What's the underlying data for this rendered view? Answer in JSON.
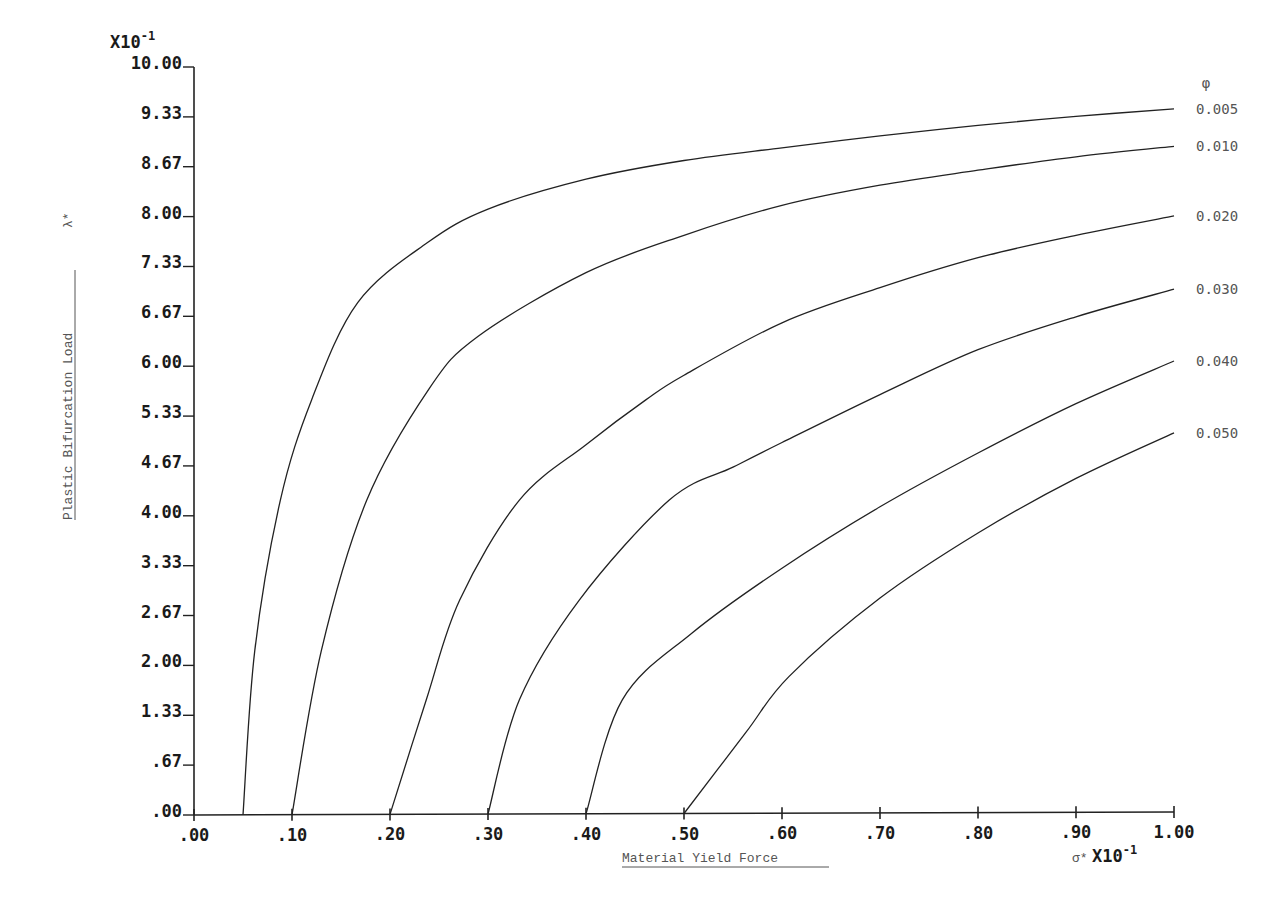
{
  "chart_data": {
    "type": "line",
    "title": "",
    "xlabel": "Material Yield Force",
    "xlabel_symbol": "σ*",
    "x_multiplier": "X10",
    "x_multiplier_exp": "-1",
    "ylabel": "Plastic Bifurcation Load",
    "ylabel_symbol": "λ*",
    "y_multiplier": "X10",
    "y_multiplier_exp": "-1",
    "xlim": [
      0,
      1
    ],
    "ylim": [
      0,
      10
    ],
    "grid": false,
    "legend_title": "φ",
    "legend_position": "right, at curve ends",
    "x_ticks": [
      {
        "value": 0.0,
        "label": ".00"
      },
      {
        "value": 0.1,
        "label": ".10"
      },
      {
        "value": 0.2,
        "label": ".20"
      },
      {
        "value": 0.3,
        "label": ".30"
      },
      {
        "value": 0.4,
        "label": ".40"
      },
      {
        "value": 0.5,
        "label": ".50"
      },
      {
        "value": 0.6,
        "label": ".60"
      },
      {
        "value": 0.7,
        "label": ".70"
      },
      {
        "value": 0.8,
        "label": ".80"
      },
      {
        "value": 0.9,
        "label": ".90"
      },
      {
        "value": 1.0,
        "label": "1.00"
      }
    ],
    "y_ticks": [
      {
        "value": 0.0,
        "label": ".00"
      },
      {
        "value": 0.667,
        "label": ".67"
      },
      {
        "value": 1.333,
        "label": "1.33"
      },
      {
        "value": 2.0,
        "label": "2.00"
      },
      {
        "value": 2.667,
        "label": "2.67"
      },
      {
        "value": 3.333,
        "label": "3.33"
      },
      {
        "value": 4.0,
        "label": "4.00"
      },
      {
        "value": 4.667,
        "label": "4.67"
      },
      {
        "value": 5.333,
        "label": "5.33"
      },
      {
        "value": 6.0,
        "label": "6.00"
      },
      {
        "value": 6.667,
        "label": "6.67"
      },
      {
        "value": 7.333,
        "label": "7.33"
      },
      {
        "value": 8.0,
        "label": "8.00"
      },
      {
        "value": 8.667,
        "label": "8.67"
      },
      {
        "value": 9.333,
        "label": "9.33"
      },
      {
        "value": 10.0,
        "label": "10.00"
      }
    ],
    "series": [
      {
        "name": "0.005",
        "points": [
          [
            0.05,
            0
          ],
          [
            0.062,
            2.2
          ],
          [
            0.088,
            4.2
          ],
          [
            0.12,
            5.55
          ],
          [
            0.167,
            6.85
          ],
          [
            0.238,
            7.65
          ],
          [
            0.3,
            8.1
          ],
          [
            0.4,
            8.5
          ],
          [
            0.5,
            8.75
          ],
          [
            0.6,
            8.92
          ],
          [
            0.7,
            9.08
          ],
          [
            0.8,
            9.22
          ],
          [
            0.9,
            9.34
          ],
          [
            1.0,
            9.44
          ]
        ]
      },
      {
        "name": "0.010",
        "points": [
          [
            0.1,
            0
          ],
          [
            0.13,
            2.2
          ],
          [
            0.176,
            4.2
          ],
          [
            0.24,
            5.7
          ],
          [
            0.29,
            6.4
          ],
          [
            0.4,
            7.25
          ],
          [
            0.5,
            7.75
          ],
          [
            0.6,
            8.15
          ],
          [
            0.7,
            8.42
          ],
          [
            0.8,
            8.62
          ],
          [
            0.9,
            8.8
          ],
          [
            1.0,
            8.94
          ]
        ]
      },
      {
        "name": "0.020",
        "points": [
          [
            0.2,
            0
          ],
          [
            0.237,
            1.54
          ],
          [
            0.271,
            2.87
          ],
          [
            0.332,
            4.21
          ],
          [
            0.4,
            4.95
          ],
          [
            0.461,
            5.55
          ],
          [
            0.5,
            5.88
          ],
          [
            0.6,
            6.58
          ],
          [
            0.7,
            7.05
          ],
          [
            0.8,
            7.45
          ],
          [
            0.9,
            7.75
          ],
          [
            1.0,
            8.01
          ]
        ]
      },
      {
        "name": "0.030",
        "points": [
          [
            0.3,
            0
          ],
          [
            0.332,
            1.54
          ],
          [
            0.393,
            2.87
          ],
          [
            0.485,
            4.21
          ],
          [
            0.55,
            4.65
          ],
          [
            0.6,
            4.98
          ],
          [
            0.7,
            5.62
          ],
          [
            0.8,
            6.22
          ],
          [
            0.9,
            6.66
          ],
          [
            1.0,
            7.03
          ]
        ]
      },
      {
        "name": "0.040",
        "points": [
          [
            0.4,
            0
          ],
          [
            0.437,
            1.54
          ],
          [
            0.508,
            2.43
          ],
          [
            0.6,
            3.3
          ],
          [
            0.7,
            4.12
          ],
          [
            0.8,
            4.84
          ],
          [
            0.9,
            5.5
          ],
          [
            1.0,
            6.07
          ]
        ]
      },
      {
        "name": "0.050",
        "points": [
          [
            0.5,
            0
          ],
          [
            0.563,
            1.1
          ],
          [
            0.607,
            1.85
          ],
          [
            0.7,
            2.9
          ],
          [
            0.8,
            3.77
          ],
          [
            0.9,
            4.5
          ],
          [
            1.0,
            5.11
          ]
        ]
      }
    ]
  },
  "labels": {
    "y_multiplier": "X10",
    "y_multiplier_exp": "-1",
    "x_multiplier": "X10",
    "x_multiplier_exp": "-1",
    "x_symbol": "σ*",
    "y_symbol": "λ*",
    "x_title": "Material Yield Force",
    "y_title": "Plastic Bifurcation Load",
    "legend_title": "φ"
  }
}
